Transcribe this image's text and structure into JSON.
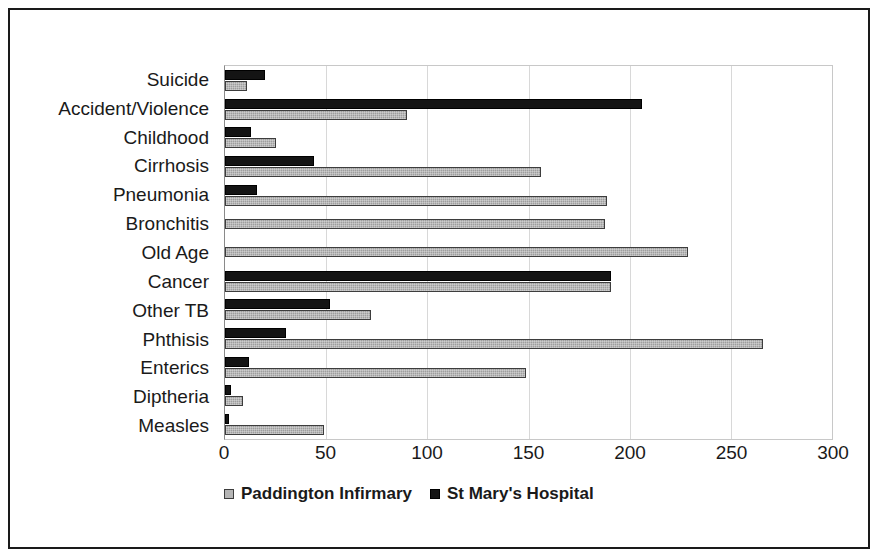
{
  "chart_data": {
    "type": "bar",
    "orientation": "horizontal",
    "title": "",
    "subtitle": "",
    "xlabel": "",
    "ylabel": "",
    "xlim": [
      0,
      300
    ],
    "xticks": [
      0,
      50,
      100,
      150,
      200,
      250,
      300
    ],
    "xtick_labels": [
      "0",
      "50",
      "100",
      "150",
      "200",
      "250",
      "300"
    ],
    "grid": true,
    "grid_axis": "x",
    "legend_position": "bottom",
    "categories": [
      "Suicide",
      "Accident/Violence",
      "Childhood",
      "Cirrhosis",
      "Pneumonia",
      "Bronchitis",
      "Old Age",
      "Cancer",
      "Other TB",
      "Phthisis",
      "Enterics",
      "Diptheria",
      "Measles"
    ],
    "series": [
      {
        "name": "Paddington Infirmary",
        "color": "#9e9e9e",
        "values": [
          11,
          90,
          25,
          156,
          189,
          188,
          229,
          191,
          72,
          266,
          149,
          9,
          49
        ]
      },
      {
        "name": "St Mary's Hospital",
        "color": "#141414",
        "values": [
          20,
          206,
          13,
          44,
          16,
          0,
          0,
          191,
          52,
          30,
          12,
          3,
          2
        ]
      }
    ]
  },
  "legend": {
    "items": [
      {
        "label": "Paddington Infirmary",
        "swatch": "gray"
      },
      {
        "label": "St Mary's Hospital",
        "swatch": "black"
      }
    ]
  }
}
